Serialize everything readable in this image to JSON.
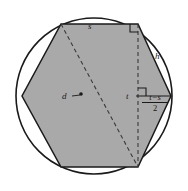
{
  "figure": {
    "background_color": "#ffffff",
    "stroke_color": "#1a1a1a",
    "hexagon_fill_color": "#a9a9a9",
    "circle_fill_color": "#ffffff",
    "width": 188,
    "height": 191,
    "labels": {
      "side_top": "s",
      "slant_edge": "h",
      "diagonal": "d",
      "half_width": "t",
      "fraction_numerator": "t−s",
      "fraction_denominator": "2"
    },
    "geometry": {
      "circle": {
        "cx": 94,
        "cy": 96,
        "r": 78
      },
      "hexagon_points": "61,24 138,24 171,96 138,167 61,167 22,96",
      "dashed_vertical": {
        "x": 138,
        "y1": 24,
        "y2": 167
      },
      "dashed_diagonal": {
        "x1": 61,
        "y1": 24,
        "x2": 138,
        "y2": 167
      },
      "horizontal_t": {
        "x1": 138,
        "y1": 96,
        "x2": 171,
        "y2": 96
      },
      "center_dot": {
        "cx": 80,
        "cy": 94,
        "r": 2
      },
      "right_angle_markers": [
        {
          "x": 130,
          "y": 24,
          "size": 8,
          "dir": "down-left"
        },
        {
          "x": 138,
          "y": 88,
          "size": 8,
          "dir": "right-down"
        }
      ]
    }
  }
}
